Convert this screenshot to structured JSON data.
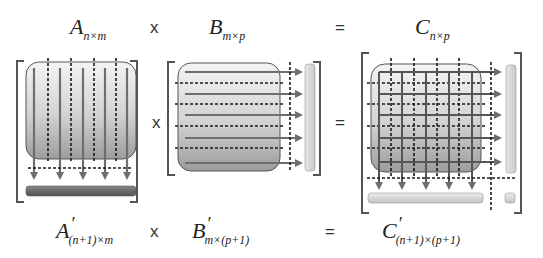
{
  "top_row": {
    "a_label": {
      "base": "A",
      "sub": "n×m"
    },
    "op1": "x",
    "b_label": {
      "base": "B",
      "sub": "m×p"
    },
    "op2": "=",
    "c_label": {
      "base": "C",
      "sub": "n×p"
    }
  },
  "middle_row": {
    "op1": "x",
    "op2": "="
  },
  "bottom_row": {
    "a_label": {
      "base": "A",
      "prime": "′",
      "sub": "(n+1)×m"
    },
    "op1": "x",
    "b_label": {
      "base": "B",
      "prime": "′",
      "sub": "m×(p+1)"
    },
    "op2": "=",
    "c_label": {
      "base": "C",
      "prime": "′",
      "sub": "(n+1)×(p+1)"
    }
  },
  "colors": {
    "bracket": "#555555",
    "matrix_fill_top": "#f2f2f2",
    "matrix_fill_bottom": "#9a9a9a",
    "arrow": "#6e6e6e",
    "dashed": "#1a1a1a",
    "checksum_dark": "#6a6a6a",
    "checksum_light": "#d6d6d6"
  }
}
